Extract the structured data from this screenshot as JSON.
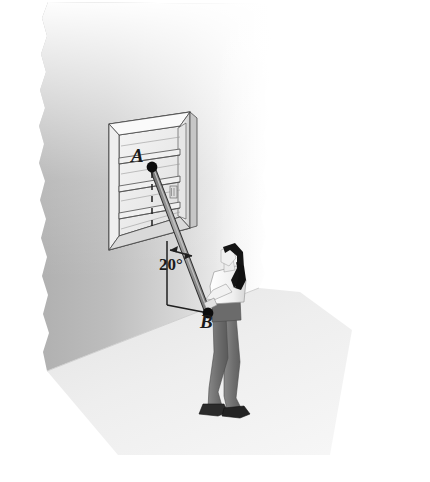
{
  "figure": {
    "kind": "physics-textbook-illustration",
    "labels": {
      "point_a": "A",
      "point_b": "B",
      "angle": "20°"
    },
    "icons": {
      "point_a_marker": "point-dot-icon",
      "point_b_marker": "point-dot-icon",
      "angle_arrow": "double-arrow-icon",
      "person": "person-standing-icon",
      "window": "window-icon"
    },
    "colors": {
      "wall_dark": "#b4b4b4",
      "wall_light": "#fdfdfd",
      "floor": "#eeeeee",
      "frame_light": "#f2f2f2",
      "frame_mid": "#c9c9c9",
      "outline": "#3a3a3a",
      "rod": "#9a9a9a",
      "marker": "#111111",
      "hair": "#141414",
      "shirt": "#f7f7f7",
      "pants": "#6f6f6f",
      "shoes": "#2b2b2b"
    },
    "geometry": {
      "point_a": [
        152,
        167
      ],
      "point_b": [
        208,
        313
      ],
      "angle_degrees": 20,
      "vertical_ref_top": [
        167,
        243
      ],
      "vertical_ref_bottom": [
        167,
        305
      ]
    }
  }
}
